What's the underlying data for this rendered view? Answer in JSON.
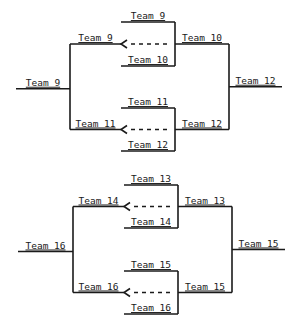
{
  "brackets": [
    {
      "name": "bracket-top",
      "matches": [
        {
          "top": "Team 9",
          "bottom": "Team 10",
          "winner": "Team 10",
          "loser_back": "Team 9"
        },
        {
          "top": "Team 11",
          "bottom": "Team 12",
          "winner": "Team 12",
          "loser_back": "Team 11"
        }
      ],
      "final_winner": "Team 12",
      "consolation_winner": "Team 9"
    },
    {
      "name": "bracket-bottom",
      "matches": [
        {
          "top": "Team 13",
          "bottom": "Team 14",
          "winner": "Team 13",
          "loser_back": "Team 14"
        },
        {
          "top": "Team 15",
          "bottom": "Team 16",
          "winner": "Team 15",
          "loser_back": "Team 16"
        }
      ],
      "final_winner": "Team 15",
      "consolation_winner": "Team 16"
    }
  ]
}
